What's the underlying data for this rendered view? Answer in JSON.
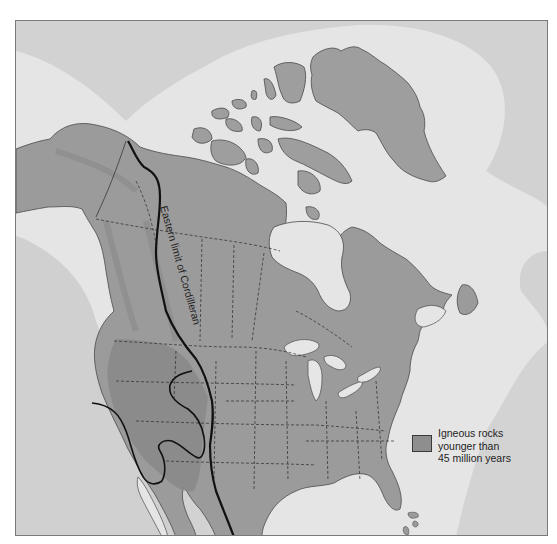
{
  "map": {
    "region": "North America",
    "annotations": {
      "cordilleran_line_label": "Eastern limit of Cordilleran"
    },
    "legend": {
      "items": [
        {
          "label": "Igneous rocks\nyounger than\n45 million years",
          "swatch_color": "#8e8e8e"
        }
      ]
    },
    "colors": {
      "ocean_deep": "#cfcfcf",
      "ocean_shelf": "#e4e4e4",
      "land": "#9c9c9c",
      "igneous": "#8a8a8a",
      "cordillera_shade": "#8f8f8f",
      "lakes": "#e6e6e6",
      "lines": "#1a1a1a",
      "frame": "#7a7a7a"
    }
  }
}
